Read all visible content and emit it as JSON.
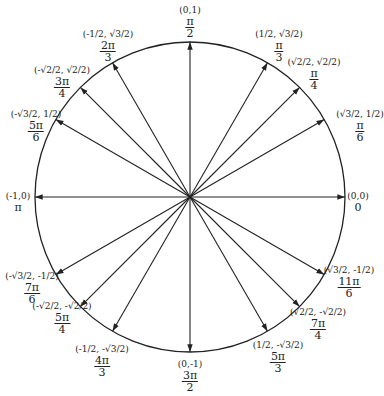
{
  "circle": {
    "cx": 190,
    "cy": 197,
    "r": 155,
    "stroke": "#222222"
  },
  "points": [
    {
      "id": "0",
      "angle_deg": 0,
      "coord": "(0,0)",
      "angle_num": "0",
      "angle_den": "",
      "lx": 358,
      "ly": 192
    },
    {
      "id": "pi6",
      "angle_deg": 30,
      "coord": "(√3/2, 1/2)",
      "angle_num": "π",
      "angle_den": "6",
      "lx": 360,
      "ly": 110
    },
    {
      "id": "pi4",
      "angle_deg": 45,
      "coord": "(√2/2, √2/2)",
      "angle_num": "π",
      "angle_den": "4",
      "lx": 314,
      "ly": 58
    },
    {
      "id": "pi3",
      "angle_deg": 60,
      "coord": "(1/2, √3/2)",
      "angle_num": "π",
      "angle_den": "3",
      "lx": 279,
      "ly": 30
    },
    {
      "id": "pi2",
      "angle_deg": 90,
      "coord": "(0,1)",
      "angle_num": "π",
      "angle_den": "2",
      "lx": 190,
      "ly": 6
    },
    {
      "id": "2pi3",
      "angle_deg": 120,
      "coord": "(-1/2, √3/2)",
      "angle_num": "2π",
      "angle_den": "3",
      "lx": 108,
      "ly": 30
    },
    {
      "id": "3pi4",
      "angle_deg": 135,
      "coord": "(-√2/2, √2/2)",
      "angle_num": "3π",
      "angle_den": "4",
      "lx": 62,
      "ly": 66
    },
    {
      "id": "5pi6",
      "angle_deg": 150,
      "coord": "(-√3/2, 1/2)",
      "angle_num": "5π",
      "angle_den": "6",
      "lx": 36,
      "ly": 110
    },
    {
      "id": "pi",
      "angle_deg": 180,
      "coord": "(-1,0)",
      "angle_num": "π",
      "angle_den": "",
      "lx": 18,
      "ly": 192
    },
    {
      "id": "7pi6",
      "angle_deg": 210,
      "coord": "(-√3/2, -1/2)",
      "angle_num": "7π",
      "angle_den": "6",
      "lx": 32,
      "ly": 272
    },
    {
      "id": "5pi4",
      "angle_deg": 225,
      "coord": "(-√2/2, -√2/2)",
      "angle_num": "5π",
      "angle_den": "4",
      "lx": 62,
      "ly": 302
    },
    {
      "id": "4pi3",
      "angle_deg": 240,
      "coord": "(-1/2, -√3/2)",
      "angle_num": "4π",
      "angle_den": "3",
      "lx": 102,
      "ly": 345
    },
    {
      "id": "3pi2",
      "angle_deg": 270,
      "coord": "(0,-1)",
      "angle_num": "3π",
      "angle_den": "2",
      "lx": 190,
      "ly": 360
    },
    {
      "id": "5pi3",
      "angle_deg": 300,
      "coord": "(1/2, -√3/2)",
      "angle_num": "5π",
      "angle_den": "3",
      "lx": 278,
      "ly": 341
    },
    {
      "id": "7pi4",
      "angle_deg": 315,
      "coord": "(√2/2, -√2/2)",
      "angle_num": "7π",
      "angle_den": "4",
      "lx": 318,
      "ly": 308
    },
    {
      "id": "11pi6",
      "angle_deg": 330,
      "coord": "(√3/2, -1/2)",
      "angle_num": "11π",
      "angle_den": "6",
      "lx": 349,
      "ly": 266
    }
  ]
}
